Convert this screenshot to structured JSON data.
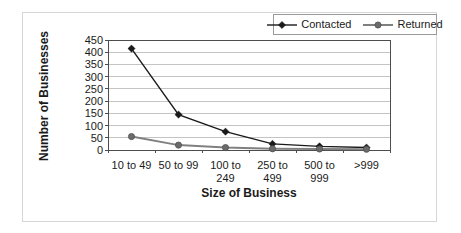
{
  "chart_data": {
    "type": "line",
    "title": "",
    "xlabel": "Size of Business",
    "ylabel": "Number of Businesses",
    "categories": [
      "10 to 49",
      "50 to 99",
      "100 to 249",
      "250 to 499",
      "500 to 999",
      ">999"
    ],
    "category_label_lines": [
      [
        "10 to 49"
      ],
      [
        "50 to 99"
      ],
      [
        "100 to",
        "249"
      ],
      [
        "250 to",
        "499"
      ],
      [
        "500 to",
        "999"
      ],
      [
        ">999"
      ]
    ],
    "series": [
      {
        "name": "Contacted",
        "values": [
          415,
          145,
          75,
          25,
          15,
          10
        ],
        "color": "#1a1a1a",
        "marker": "diamond",
        "marker_fill": "#1a1a1a",
        "line_width": 1.4
      },
      {
        "name": "Returned",
        "values": [
          55,
          20,
          10,
          5,
          4,
          3
        ],
        "color": "#808080",
        "marker": "circle",
        "marker_fill": "#6b6b6b",
        "line_width": 2
      }
    ],
    "ylim": [
      0,
      450
    ],
    "yticks": [
      0,
      50,
      100,
      150,
      200,
      250,
      300,
      350,
      400,
      450
    ],
    "grid": true,
    "legend_position": "top-right"
  },
  "colors": {
    "background": "#ffffff",
    "text": "#1a1a1a",
    "gridline": "#c4c4c4",
    "plot_border": "#4d4d4d",
    "legend_border": "#9a9a9a",
    "frame_border": "#d6d6d6"
  }
}
